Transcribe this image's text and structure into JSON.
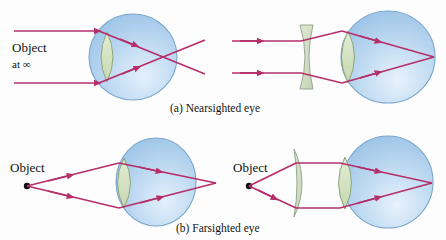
{
  "figure": {
    "title_hidden": "Correction of nearsighted and farsighted eyes",
    "background_color": "#fdfdfd"
  },
  "palette": {
    "eye_fill_dark": "#9ec6e8",
    "eye_fill_light": "#dcecf9",
    "eye_outline": "#7aa6cc",
    "lens_fill": "#d7e4c6",
    "lens_outline": "#8fa37f",
    "corrective_lens_fill": "#d5e2c6",
    "corrective_lens_outline": "#9aa894",
    "ray_color": "#b52f6b",
    "object_dot_color": "#111111",
    "caption_color": "#141414"
  },
  "panels": [
    {
      "id": "panel-a",
      "caption": "(a) Nearsighted eye",
      "caption_x": 223,
      "caption_y": 110,
      "left_diagram": {
        "id": "nearsighted-uncorrected",
        "object_label_line1": "Object",
        "object_label_line2": "at ∞",
        "object_label_x": 12,
        "object_label_y": 52,
        "object_type": "parallel-rays-at-infinity",
        "eye": {
          "cx": 133,
          "cy": 57,
          "rx": 44,
          "ry": 43
        },
        "eye_lens": {
          "cx": 107,
          "cy": 57,
          "half_w": 11,
          "half_h": 25
        },
        "focal_point": {
          "x": 163,
          "y": 57
        },
        "ray_ys": [
          31,
          83
        ],
        "ray_start_x": 14,
        "description": "Parallel rays focus in front of the retina then diverge"
      },
      "right_diagram": {
        "id": "nearsighted-corrected",
        "object_type": "parallel-rays-at-infinity",
        "corrective_lens": {
          "type": "diverging",
          "shape": "biconcave",
          "cx": 307,
          "cy": 57,
          "half_h": 32,
          "half_w": 5
        },
        "eye": {
          "cx": 388,
          "cy": 57,
          "rx": 47,
          "ry": 46
        },
        "eye_lens": {
          "cx": 348,
          "cy": 57,
          "half_w": 12,
          "half_h": 26
        },
        "focal_point": {
          "x": 434,
          "y": 57
        },
        "ray_ys": [
          41,
          73
        ],
        "ray_start_x": 232,
        "description": "Diverging lens moves focus back onto the retina"
      }
    },
    {
      "id": "panel-b",
      "caption": "(b) Farsighted eye",
      "caption_x": 223,
      "caption_y": 230,
      "left_diagram": {
        "id": "farsighted-uncorrected",
        "object_label_line1": "Object",
        "object_label_line2": "",
        "object_label_x": 10,
        "object_label_y": 172,
        "object_point": {
          "x": 27,
          "y": 186
        },
        "eye": {
          "cx": 156,
          "cy": 182,
          "rx": 40,
          "ry": 44
        },
        "eye_lens": {
          "cx": 124,
          "cy": 183,
          "half_w": 11,
          "half_h": 25
        },
        "focal_point": {
          "x": 216,
          "y": 183
        },
        "description": "Rays from near object would focus behind the retina"
      },
      "right_diagram": {
        "id": "farsighted-corrected",
        "object_label_line1": "Object",
        "object_label_line2": "",
        "object_label_x": 233,
        "object_label_y": 172,
        "object_point": {
          "x": 249,
          "y": 186
        },
        "corrective_lens": {
          "type": "converging",
          "shape": "meniscus-convex",
          "cx": 298,
          "cy": 183,
          "half_h": 34,
          "half_w": 7
        },
        "eye": {
          "cx": 388,
          "cy": 182,
          "rx": 45,
          "ry": 46
        },
        "eye_lens": {
          "cx": 345,
          "cy": 183,
          "half_w": 12,
          "half_h": 26
        },
        "focal_point": {
          "x": 432,
          "y": 183
        },
        "description": "Converging lens brings the focus forward onto the retina"
      }
    }
  ],
  "labels": {
    "object": "Object",
    "at_infinity": "at ∞",
    "caption_a": "(a) Nearsighted eye",
    "caption_b": "(b) Farsighted eye"
  }
}
